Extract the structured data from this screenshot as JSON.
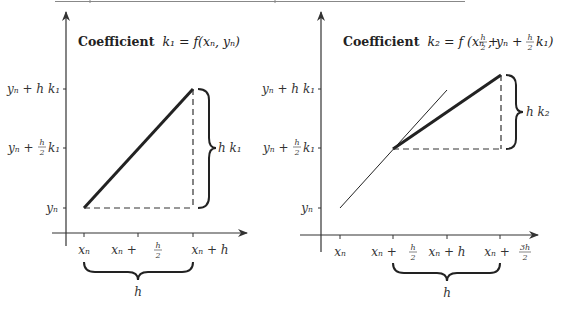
{
  "top_rule": {
    "x1": 55,
    "x2": 465,
    "y": 1
  },
  "left_panel": {
    "title_bold": "Coefficient",
    "title_math": "k₁ = f(xₙ, yₙ)",
    "y_labels": {
      "top": "yₙ + h k₁",
      "mid_prefix": "yₙ +",
      "mid_frac_num": "h",
      "mid_frac_den": "2",
      "mid_suffix": "k₁",
      "bottom": "yₙ"
    },
    "x_labels": {
      "t0": "xₙ",
      "t1_prefix": "xₙ +",
      "t1_num": "h",
      "t1_den": "2",
      "t2": "xₙ + h"
    },
    "rise_label": "h k₁",
    "run_label": "h"
  },
  "right_panel": {
    "title_bold": "Coefficient",
    "title_math_a": "k₂ = f (xₙ +",
    "title_frac1_num": "h",
    "title_frac1_den": "2",
    "title_math_b": ", yₙ +",
    "title_frac2_num": "h",
    "title_frac2_den": "2",
    "title_math_c": "k₁)",
    "y_labels": {
      "top": "yₙ + h k₁",
      "mid_prefix": "yₙ +",
      "mid_frac_num": "h",
      "mid_frac_den": "2",
      "mid_suffix": "k₁",
      "bottom": "yₙ"
    },
    "x_labels": {
      "t0": "xₙ",
      "t1_prefix": "xₙ +",
      "t1_num": "h",
      "t1_den": "2",
      "t2": "xₙ + h",
      "t3_prefix": "xₙ +",
      "t3_num": "3h",
      "t3_den": "2"
    },
    "rise_label": "h k₂",
    "run_label": "h"
  }
}
